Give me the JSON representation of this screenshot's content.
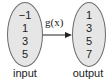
{
  "diagram": {
    "type": "function-mapping",
    "function_label": "g(x)",
    "input": {
      "label": "input",
      "values": [
        "−1",
        "1",
        "3",
        "5"
      ]
    },
    "output": {
      "label": "output",
      "values": [
        "1",
        "3",
        "5",
        "7"
      ]
    },
    "colors": {
      "ellipse_fill": "#e6e6e6",
      "ellipse_stroke": "#6a6a6a",
      "text": "#222222"
    }
  }
}
